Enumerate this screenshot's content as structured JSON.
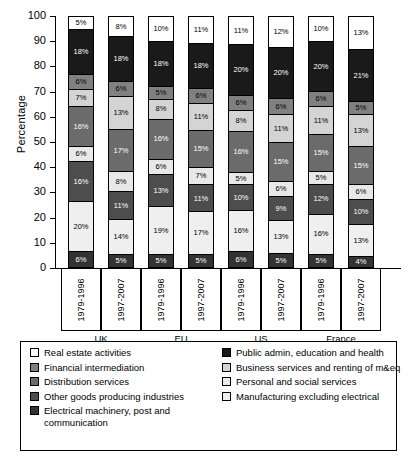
{
  "chart_data": {
    "type": "bar",
    "subtype": "stacked-percentage-column",
    "title": "",
    "xlabel": "",
    "ylabel": "Percentage",
    "ylim": [
      0,
      100
    ],
    "yticks": [
      0,
      10,
      20,
      30,
      40,
      50,
      60,
      70,
      80,
      90,
      100
    ],
    "grid": false,
    "legend_position": "bottom",
    "categories": [
      "UK 1979-1996",
      "UK 1997-2007",
      "EU 1979-1996",
      "EU 1997-2007",
      "US 1979-1996",
      "US 1997-2007",
      "France 1979-1996",
      "France 1997-2007"
    ],
    "groups": [
      {
        "region": "UK",
        "periods": [
          "1979-1996",
          "1997-2007"
        ]
      },
      {
        "region": "EU",
        "periods": [
          "1979-1996",
          "1997-2007"
        ]
      },
      {
        "region": "US",
        "periods": [
          "1979-1996",
          "1997-2007"
        ]
      },
      {
        "region": "France",
        "periods": [
          "1979-1996",
          "1997-2007"
        ]
      }
    ],
    "series": [
      {
        "name": "Real estate activities",
        "color": "#ffffff",
        "values": [
          5,
          8,
          10,
          11,
          11,
          12,
          10,
          13
        ]
      },
      {
        "name": "Public admin, education and health",
        "color": "#1a1a1a",
        "values": [
          18,
          18,
          18,
          18,
          20,
          20,
          20,
          21
        ]
      },
      {
        "name": "Financial intermediation",
        "color": "#808080",
        "values": [
          6,
          6,
          5,
          6,
          6,
          6,
          6,
          5
        ]
      },
      {
        "name": "Business services and renting of m&eq",
        "color": "#d4d4d4",
        "values": [
          7,
          13,
          8,
          11,
          8,
          11,
          11,
          13
        ]
      },
      {
        "name": "Distribution services",
        "color": "#6b6b6b",
        "values": [
          16,
          17,
          16,
          15,
          16,
          15,
          15,
          15
        ]
      },
      {
        "name": "Personal and social services",
        "color": "#e8e8e8",
        "values": [
          6,
          8,
          6,
          7,
          5,
          6,
          5,
          6
        ]
      },
      {
        "name": "Other goods producing industries",
        "color": "#4d4d4d",
        "values": [
          16,
          11,
          13,
          11,
          10,
          9,
          12,
          10
        ]
      },
      {
        "name": "Manufacturing excluding electrical",
        "color": "#efefef",
        "values": [
          20,
          14,
          19,
          17,
          16,
          13,
          16,
          13
        ]
      },
      {
        "name": "Electrical machinery, post and communication",
        "color": "#333333",
        "values": [
          6,
          5,
          5,
          5,
          6,
          5,
          5,
          4
        ]
      }
    ],
    "legend_left": [
      {
        "label": "Real estate activities",
        "color": "#ffffff"
      },
      {
        "label": "Financial intermediation",
        "color": "#808080"
      },
      {
        "label": "Distribution services",
        "color": "#6b6b6b"
      },
      {
        "label": "Other goods producing industries",
        "color": "#4d4d4d"
      },
      {
        "label": "Electrical machinery, post and communication",
        "color": "#333333"
      }
    ],
    "legend_right": [
      {
        "label": "Public admin, education and health",
        "color": "#1a1a1a"
      },
      {
        "label": "Business services and renting of m&eq",
        "color": "#d4d4d4"
      },
      {
        "label": "Personal and social services",
        "color": "#e8e8e8"
      },
      {
        "label": "Manufacturing excluding electrical",
        "color": "#efefef"
      }
    ]
  }
}
